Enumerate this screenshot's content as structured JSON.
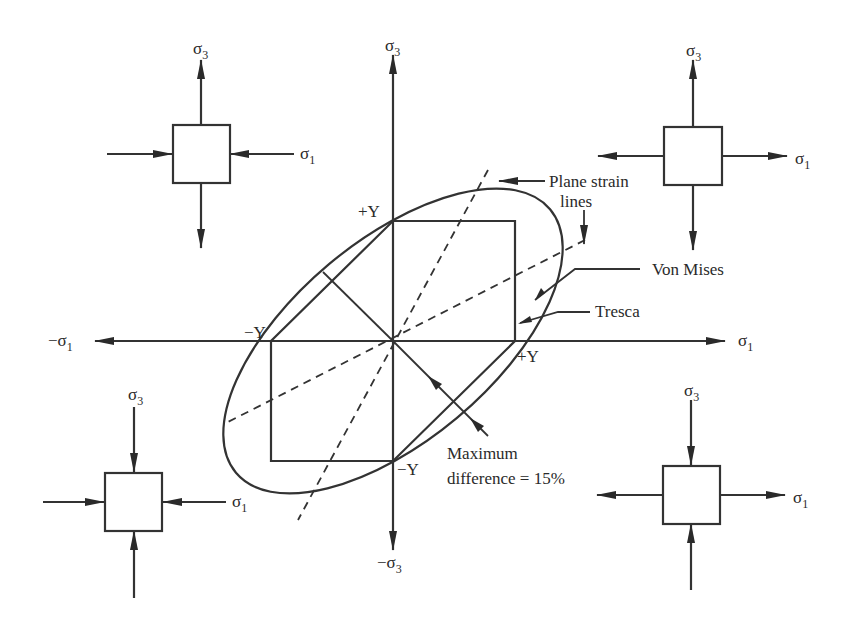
{
  "diagram": {
    "axes": {
      "x_pos": {
        "base": "σ",
        "sub": "1"
      },
      "x_neg": {
        "prefix": "−",
        "base": "σ",
        "sub": "1"
      },
      "y_pos": {
        "base": "σ",
        "sub": "3"
      },
      "y_neg": {
        "prefix": "−",
        "base": "σ",
        "sub": "3"
      }
    },
    "points": {
      "plus_y_top": "+Y",
      "minus_y_left": "−Y",
      "plus_y_right": "+Y",
      "minus_y_bottom": "−Y"
    },
    "callouts": {
      "plane_strain_line1": "Plane strain",
      "plane_strain_line2": "lines",
      "von_mises": "Von Mises",
      "tresca": "Tresca",
      "max_diff_line1": "Maximum",
      "max_diff_line2": "difference = 15%"
    },
    "stress_elements": [
      {
        "position": "top-left",
        "sigma3": "tension",
        "sigma1": "compression",
        "label_s3": {
          "base": "σ",
          "sub": "3"
        },
        "label_s1": {
          "base": "σ",
          "sub": "1"
        }
      },
      {
        "position": "top-right",
        "sigma3": "tension",
        "sigma1": "tension",
        "label_s3": {
          "base": "σ",
          "sub": "3"
        },
        "label_s1": {
          "base": "σ",
          "sub": "1"
        }
      },
      {
        "position": "bottom-left",
        "sigma3": "compression",
        "sigma1": "compression",
        "label_s3": {
          "base": "σ",
          "sub": "3"
        },
        "label_s1": {
          "base": "σ",
          "sub": "1"
        }
      },
      {
        "position": "bottom-right",
        "sigma3": "compression",
        "sigma1": "tension",
        "label_s3": {
          "base": "σ",
          "sub": "3"
        },
        "label_s1": {
          "base": "σ",
          "sub": "1"
        }
      }
    ]
  }
}
